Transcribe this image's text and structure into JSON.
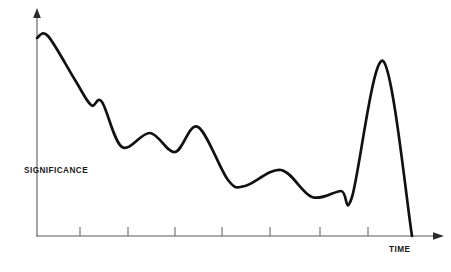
{
  "figure": {
    "background_color": "#ffffff",
    "curve_color": "#111111",
    "axis_color": "#5a5a5a",
    "width": 451,
    "height": 272
  },
  "axes": {
    "y_label": "SIGNIFICANCE",
    "x_label": "TIME",
    "x_axis_name": "time-axis",
    "y_axis_name": "significance-axis",
    "x_arrow": "arrow-right",
    "y_arrow": "arrow-up",
    "origin": {
      "x": 37,
      "y": 236
    },
    "x_end": {
      "x": 442,
      "y": 236
    },
    "y_end": {
      "x": 37,
      "y": 10
    },
    "tick_count": 7,
    "tick_positions": [
      80,
      128,
      175,
      222,
      270,
      320,
      368
    ],
    "tick_length": 9,
    "tick_labels": [
      "",
      "",
      "",
      "",
      "",
      "",
      ""
    ]
  },
  "chart_data": {
    "type": "line",
    "title": "",
    "subtitle": "",
    "xlabel": "TIME",
    "ylabel": "SIGNIFICANCE",
    "xlim": [
      0,
      100
    ],
    "ylim": [
      0,
      100
    ],
    "grid": false,
    "legend": false,
    "legend_position": "none",
    "axis_ticks_labeled": false,
    "annotations": [],
    "series": [
      {
        "name": "significance",
        "color": "#111111",
        "x": [
          0.0,
          2.7,
          6.4,
          9.4,
          13.3,
          16.0,
          18.6,
          21.0,
          23.5,
          27.9,
          34.1,
          38.3,
          42.0,
          45.4,
          49.3,
          52.8,
          55.9,
          58.9,
          62.9,
          67.7,
          72.4,
          76.2,
          79.3,
          82.7,
          85.3,
          87.8,
          89.9,
          92.5,
          95.1,
          97.8,
          100.0
        ],
        "y": [
          87.6,
          88.5,
          80.5,
          73.5,
          62.0,
          57.9,
          58.9,
          56.5,
          47.8,
          39.6,
          45.6,
          44.3,
          40.2,
          44.3,
          48.2,
          42.2,
          31.0,
          24.8,
          22.1,
          24.4,
          29.2,
          27.0,
          19.4,
          17.7,
          20.2,
          18.0,
          25.2,
          62.0,
          77.4,
          73.1,
          0.0
        ]
      }
    ],
    "anchor_points_px": [
      {
        "label": "start-on-axis",
        "x": 37,
        "y": 38
      },
      {
        "label": "initial-crest",
        "x": 48,
        "y": 36
      },
      {
        "label": "steep-decline",
        "x": 75,
        "y": 80
      },
      {
        "label": "shoulder-min",
        "x": 91,
        "y": 105
      },
      {
        "label": "shoulder-bump",
        "x": 102,
        "y": 102
      },
      {
        "label": "trough-1",
        "x": 122,
        "y": 147
      },
      {
        "label": "bump-2-peak",
        "x": 150,
        "y": 133
      },
      {
        "label": "trough-2",
        "x": 175,
        "y": 152
      },
      {
        "label": "sharp-peak-3",
        "x": 198,
        "y": 127
      },
      {
        "label": "decline-3",
        "x": 228,
        "y": 180
      },
      {
        "label": "trough-3",
        "x": 245,
        "y": 186
      },
      {
        "label": "broad-bump-peak",
        "x": 281,
        "y": 170
      },
      {
        "label": "trough-4",
        "x": 312,
        "y": 197
      },
      {
        "label": "small-bump",
        "x": 341,
        "y": 191
      },
      {
        "label": "trough-5",
        "x": 352,
        "y": 197
      },
      {
        "label": "final-spike-peak",
        "x": 383,
        "y": 61
      },
      {
        "label": "final-collapse",
        "x": 412,
        "y": 236
      }
    ]
  }
}
